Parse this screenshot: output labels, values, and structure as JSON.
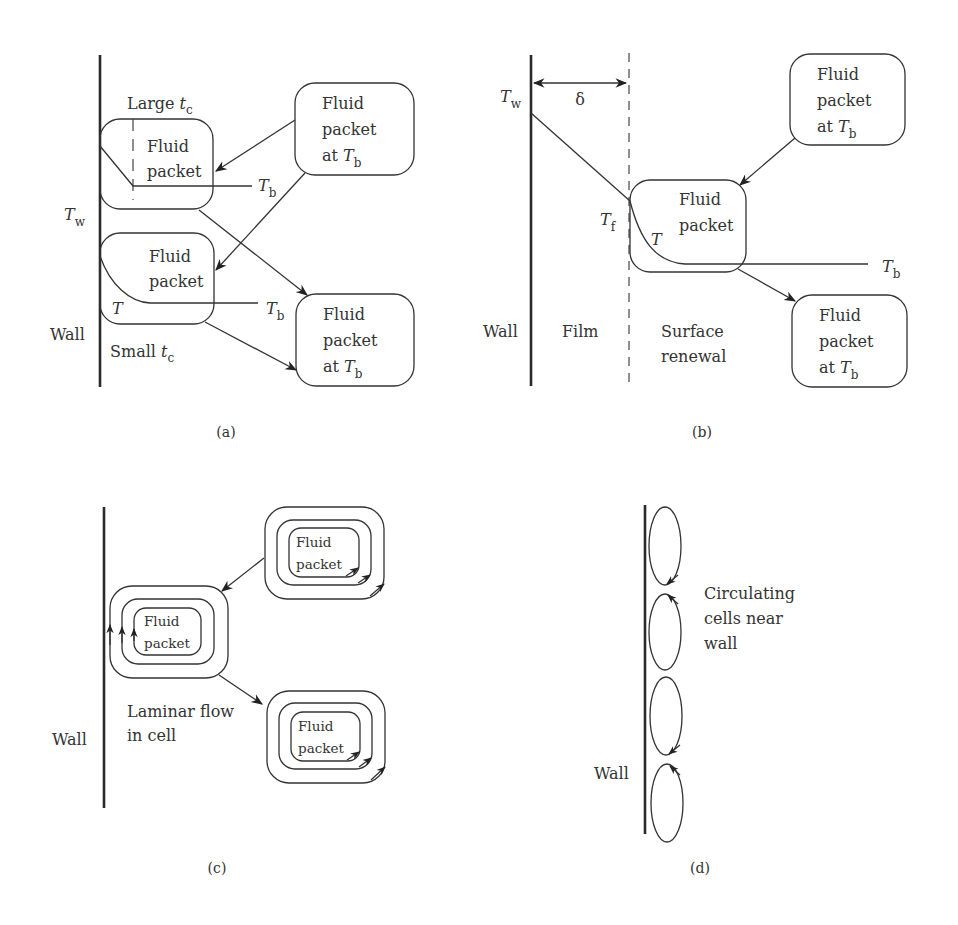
{
  "figure": {
    "panels": [
      {
        "id": "a",
        "caption": "(a)",
        "wall_label": "Wall",
        "wall_temp": {
          "symbol": "T",
          "sub": "w"
        },
        "large_tc": {
          "text": "Large ",
          "symbol": "t",
          "sub": "c"
        },
        "small_tc": {
          "text": "Small ",
          "symbol": "t",
          "sub": "c"
        },
        "packet_upper": {
          "line1": "Fluid",
          "line2": "packet"
        },
        "packet_lower": {
          "line1": "Fluid",
          "line2": "packet"
        },
        "packet_source": {
          "line1": "Fluid",
          "line2": "packet",
          "line3": "at ",
          "symbol": "T",
          "sub": "b"
        },
        "packet_sink": {
          "line1": "Fluid",
          "line2": "packet",
          "line3": "at ",
          "symbol": "T",
          "sub": "b"
        },
        "bulk_temp_upper": {
          "symbol": "T",
          "sub": "b"
        },
        "bulk_temp_lower": {
          "symbol": "T",
          "sub": "b"
        },
        "profile_label": "T"
      },
      {
        "id": "b",
        "caption": "(b)",
        "wall_label": "Wall",
        "film_label": "Film",
        "renewal_label_1": "Surface",
        "renewal_label_2": "renewal",
        "film_thickness": "δ",
        "wall_temp": {
          "symbol": "T",
          "sub": "w"
        },
        "film_temp": {
          "symbol": "T",
          "sub": "f"
        },
        "bulk_temp": {
          "symbol": "T",
          "sub": "b"
        },
        "profile_label": "T",
        "packet_source": {
          "line1": "Fluid",
          "line2": "packet",
          "line3": "at ",
          "symbol": "T",
          "sub": "b"
        },
        "packet_middle": {
          "line1": "Fluid",
          "line2": "packet"
        },
        "packet_sink": {
          "line1": "Fluid",
          "line2": "packet",
          "line3": "at ",
          "symbol": "T",
          "sub": "b"
        }
      },
      {
        "id": "c",
        "caption": "(c)",
        "wall_label": "Wall",
        "flow_label_1": "Laminar flow",
        "flow_label_2": "in cell",
        "cells": [
          {
            "line1": "Fluid",
            "line2": "packet"
          },
          {
            "line1": "Fluid",
            "line2": "packet"
          },
          {
            "line1": "Fluid",
            "line2": "packet"
          }
        ]
      },
      {
        "id": "d",
        "caption": "(d)",
        "wall_label": "Wall",
        "cells_label_1": "Circulating",
        "cells_label_2": "cells near",
        "cells_label_3": "wall",
        "cell_count": 4
      }
    ]
  }
}
